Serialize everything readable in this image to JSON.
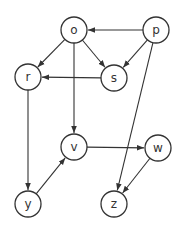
{
  "graph": {
    "type": "directed",
    "nodes": [
      {
        "id": "o",
        "label": "o",
        "x": 74,
        "y": 30
      },
      {
        "id": "p",
        "label": "p",
        "x": 156,
        "y": 30
      },
      {
        "id": "r",
        "label": "r",
        "x": 28,
        "y": 77
      },
      {
        "id": "s",
        "label": "s",
        "x": 114,
        "y": 78
      },
      {
        "id": "v",
        "label": "v",
        "x": 74,
        "y": 147
      },
      {
        "id": "w",
        "label": "w",
        "x": 158,
        "y": 148
      },
      {
        "id": "y",
        "label": "y",
        "x": 28,
        "y": 204
      },
      {
        "id": "z",
        "label": "z",
        "x": 114,
        "y": 204
      }
    ],
    "edges": [
      {
        "from": "p",
        "to": "o"
      },
      {
        "from": "o",
        "to": "r"
      },
      {
        "from": "o",
        "to": "s"
      },
      {
        "from": "o",
        "to": "v"
      },
      {
        "from": "p",
        "to": "s"
      },
      {
        "from": "s",
        "to": "r"
      },
      {
        "from": "p",
        "to": "z"
      },
      {
        "from": "r",
        "to": "y"
      },
      {
        "from": "y",
        "to": "v"
      },
      {
        "from": "v",
        "to": "w"
      },
      {
        "from": "w",
        "to": "z"
      }
    ],
    "node_radius": 13,
    "colors": {
      "stroke": "#333333",
      "fill": "#ffffff",
      "background": "#ffffff"
    }
  }
}
